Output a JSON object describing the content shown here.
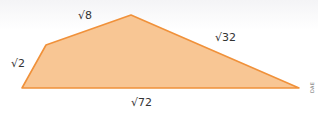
{
  "figure": {
    "shape": "quadrilateral",
    "fill_color": "#f8c694",
    "stroke_color": "#f0913a",
    "vertices": [
      [
        22,
        88
      ],
      [
        46,
        45
      ],
      [
        131,
        15
      ],
      [
        299,
        88
      ]
    ],
    "side_labels": {
      "left": "√2",
      "top_left": "√8",
      "top_right": "√32",
      "bottom": "√72"
    },
    "credit": "DAE"
  }
}
